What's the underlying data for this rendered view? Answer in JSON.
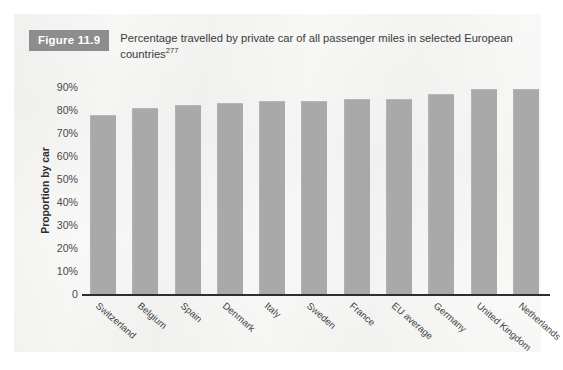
{
  "figure": {
    "badge_label": "Figure 11.9",
    "caption_text": "Percentage travelled by private car of all passenger miles in selected European countries",
    "caption_reference": "277",
    "badge_color": "#8d8d8d",
    "panel_background": "#f8f8f7",
    "bar_color": "#a9a9a9"
  },
  "chart_data": {
    "type": "bar",
    "title": "Percentage travelled by private car of all passenger miles in selected European countries",
    "xlabel": "",
    "ylabel": "Proportion by car",
    "ylim": [
      0,
      90
    ],
    "grid": false,
    "legend": "none",
    "y_tick_labels": [
      "90%",
      "80%",
      "70%",
      "60%",
      "50%",
      "40%",
      "30%",
      "20%",
      "10%",
      "0"
    ],
    "y_tick_values": [
      90,
      80,
      70,
      60,
      50,
      40,
      30,
      20,
      10,
      0
    ],
    "categories": [
      "Switzerland",
      "Belgium",
      "Spain",
      "Denmark",
      "Italy",
      "Sweden",
      "France",
      "EU average",
      "Germany",
      "United Kingdom",
      "Netherlands"
    ],
    "values": [
      78,
      81,
      82,
      83,
      84,
      84,
      85,
      85,
      87,
      89,
      89
    ]
  }
}
